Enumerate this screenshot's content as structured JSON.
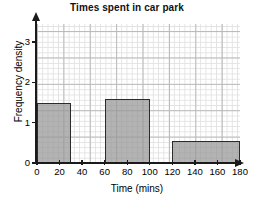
{
  "chart_data": {
    "type": "bar",
    "title": "Times spent in car park",
    "xlabel": "Time (mins)",
    "ylabel": "Frequency density",
    "xlim": [
      0,
      180
    ],
    "ylim": [
      0,
      3.4
    ],
    "grid": true,
    "legend": "none",
    "xticks": [
      "0",
      "20",
      "40",
      "60",
      "80",
      "100",
      "120",
      "140",
      "160",
      "180"
    ],
    "xtick_values": [
      0,
      20,
      40,
      60,
      80,
      100,
      120,
      140,
      160,
      180
    ],
    "yticks": [
      "0",
      "1",
      "2",
      "3"
    ],
    "ytick_values": [
      0,
      1,
      2,
      3
    ],
    "bars": [
      {
        "label": "0-30",
        "x_start": 0,
        "x_end": 30,
        "value": 1.5
      },
      {
        "label": "60-100",
        "x_start": 60,
        "x_end": 100,
        "value": 1.6
      },
      {
        "label": "120-180",
        "x_start": 120,
        "x_end": 180,
        "value": 0.55
      }
    ],
    "bar_fill_color": "#969696",
    "bar_edge_color": "#2b2b2b",
    "axis_color": "#1a1a1a",
    "grid_color": "#e2e2e2",
    "grid_major_color": "#b9b9b9"
  }
}
